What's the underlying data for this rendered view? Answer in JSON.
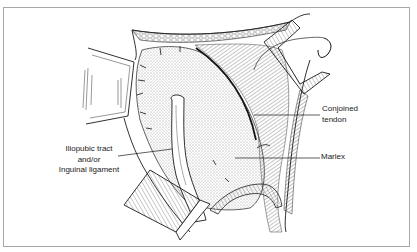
{
  "figure": {
    "type": "surgical illustration",
    "style": "black-and-white line art",
    "colors": {
      "background": "#ffffff",
      "frame_border": "#a8a8a8",
      "ink": "#1a1a1a"
    }
  },
  "labels": {
    "conjoined_tendon": {
      "line1": "Conjoined",
      "line2": "tendon"
    },
    "marlex": {
      "text": "Marlex"
    },
    "iliopubic_tract": {
      "line1": "Iliopubic tract",
      "line2": "and/or",
      "line3": "Inguinal ligament"
    }
  }
}
